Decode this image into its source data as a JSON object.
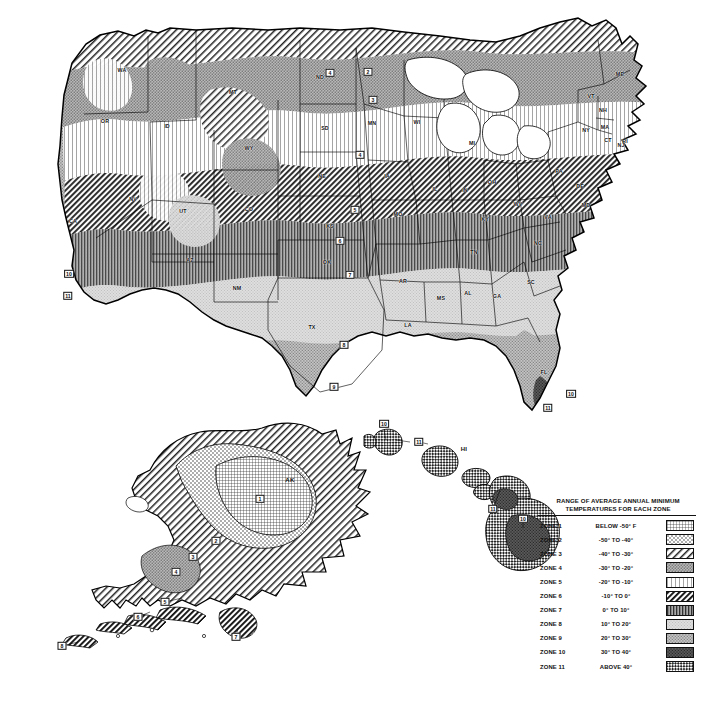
{
  "document": {
    "type": "map",
    "title": "USDA Plant Hardiness Zone Map",
    "corner_mark": "r"
  },
  "legend": {
    "heading_line1": "RANGE OF AVERAGE ANNUAL MINIMUM",
    "heading_line2": "TEMPERATURES FOR EACH ZONE",
    "rows": [
      {
        "zone": "ZONE 1",
        "range": "BELOW -50° F",
        "pattern": "grid-fine",
        "fill": "#ffffff",
        "ink": "#2b2b2b"
      },
      {
        "zone": "ZONE 2",
        "range": "-50°  TO -40°",
        "pattern": "dots-coarse",
        "fill": "#ffffff",
        "ink": "#333333"
      },
      {
        "zone": "ZONE 3",
        "range": "-40°  TO -30°",
        "pattern": "hatch-back-wide",
        "fill": "#ffffff",
        "ink": "#222222"
      },
      {
        "zone": "ZONE 4",
        "range": "-30°  TO -20°",
        "pattern": "stipple-mid",
        "fill": "#b9b9b9",
        "ink": "#4a4a4a"
      },
      {
        "zone": "ZONE 5",
        "range": "-20°  TO -10°",
        "pattern": "vert-light",
        "fill": "#ffffff",
        "ink": "#8a8a8a"
      },
      {
        "zone": "ZONE 6",
        "range": "-10°  TO   0°",
        "pattern": "hatch-back-bold",
        "fill": "#ffffff",
        "ink": "#111111"
      },
      {
        "zone": "ZONE 7",
        "range": "0°   TO  10°",
        "pattern": "vert-bold",
        "fill": "#a9a9a9",
        "ink": "#303030"
      },
      {
        "zone": "ZONE 8",
        "range": "10°   TO  20°",
        "pattern": "stipple-light",
        "fill": "#dedede",
        "ink": "#9a9a9a"
      },
      {
        "zone": "ZONE 9",
        "range": "20°   TO  30°",
        "pattern": "stipple-mid2",
        "fill": "#c4c4c4",
        "ink": "#6f6f6f"
      },
      {
        "zone": "ZONE 10",
        "range": "30°   TO  40°",
        "pattern": "dark-solid",
        "fill": "#5a5a5a",
        "ink": "#2a2a2a"
      },
      {
        "zone": "ZONE 11",
        "range": "ABOVE 40°",
        "pattern": "checker",
        "fill": "#ffffff",
        "ink": "#222222"
      }
    ]
  },
  "main_map": {
    "name": "contiguous-united-states",
    "state_labels": [
      {
        "abbr": "WA",
        "x": 122,
        "y": 70
      },
      {
        "abbr": "OR",
        "x": 105,
        "y": 121
      },
      {
        "abbr": "ID",
        "x": 167,
        "y": 126
      },
      {
        "abbr": "MT",
        "x": 233,
        "y": 92
      },
      {
        "abbr": "WY",
        "x": 249,
        "y": 148
      },
      {
        "abbr": "NV",
        "x": 133,
        "y": 199
      },
      {
        "abbr": "UT",
        "x": 183,
        "y": 211
      },
      {
        "abbr": "CA",
        "x": 73,
        "y": 221
      },
      {
        "abbr": "AZ",
        "x": 190,
        "y": 260
      },
      {
        "abbr": "NM",
        "x": 237,
        "y": 288
      },
      {
        "abbr": "CO",
        "x": 249,
        "y": 209
      },
      {
        "abbr": "ND",
        "x": 320,
        "y": 77
      },
      {
        "abbr": "SD",
        "x": 325,
        "y": 128
      },
      {
        "abbr": "NE",
        "x": 322,
        "y": 176
      },
      {
        "abbr": "KS",
        "x": 330,
        "y": 226
      },
      {
        "abbr": "OK",
        "x": 327,
        "y": 262
      },
      {
        "abbr": "TX",
        "x": 312,
        "y": 327
      },
      {
        "abbr": "MN",
        "x": 372,
        "y": 123
      },
      {
        "abbr": "IA",
        "x": 387,
        "y": 176
      },
      {
        "abbr": "MO",
        "x": 398,
        "y": 214
      },
      {
        "abbr": "AR",
        "x": 403,
        "y": 281
      },
      {
        "abbr": "LA",
        "x": 408,
        "y": 325
      },
      {
        "abbr": "WI",
        "x": 417,
        "y": 122
      },
      {
        "abbr": "IL",
        "x": 435,
        "y": 189
      },
      {
        "abbr": "MS",
        "x": 441,
        "y": 298
      },
      {
        "abbr": "AL",
        "x": 468,
        "y": 293
      },
      {
        "abbr": "MI",
        "x": 472,
        "y": 143
      },
      {
        "abbr": "IN",
        "x": 465,
        "y": 190
      },
      {
        "abbr": "OH",
        "x": 492,
        "y": 182
      },
      {
        "abbr": "KY",
        "x": 485,
        "y": 219
      },
      {
        "abbr": "TN",
        "x": 474,
        "y": 252
      },
      {
        "abbr": "GA",
        "x": 497,
        "y": 296
      },
      {
        "abbr": "FL",
        "x": 544,
        "y": 372
      },
      {
        "abbr": "SC",
        "x": 531,
        "y": 282
      },
      {
        "abbr": "NC",
        "x": 538,
        "y": 243
      },
      {
        "abbr": "WV",
        "x": 518,
        "y": 204
      },
      {
        "abbr": "VA",
        "x": 548,
        "y": 217
      },
      {
        "abbr": "MD",
        "x": 586,
        "y": 205
      },
      {
        "abbr": "DE",
        "x": 580,
        "y": 186
      },
      {
        "abbr": "PA",
        "x": 559,
        "y": 171
      },
      {
        "abbr": "NY",
        "x": 586,
        "y": 130
      },
      {
        "abbr": "NJ",
        "x": 621,
        "y": 145
      },
      {
        "abbr": "CT",
        "x": 608,
        "y": 140
      },
      {
        "abbr": "RI",
        "x": 625,
        "y": 141
      },
      {
        "abbr": "MA",
        "x": 605,
        "y": 127
      },
      {
        "abbr": "VT",
        "x": 591,
        "y": 96
      },
      {
        "abbr": "NH",
        "x": 603,
        "y": 110
      },
      {
        "abbr": "ME",
        "x": 620,
        "y": 74
      }
    ],
    "zone_markers": [
      {
        "zone": "4",
        "x": 330,
        "y": 73
      },
      {
        "zone": "3",
        "x": 373,
        "y": 100
      },
      {
        "zone": "2",
        "x": 368,
        "y": 72
      },
      {
        "zone": "4",
        "x": 360,
        "y": 155
      },
      {
        "zone": "5",
        "x": 355,
        "y": 210
      },
      {
        "zone": "6",
        "x": 340,
        "y": 241
      },
      {
        "zone": "7",
        "x": 350,
        "y": 275
      },
      {
        "zone": "8",
        "x": 344,
        "y": 345
      },
      {
        "zone": "9",
        "x": 334,
        "y": 387
      },
      {
        "zone": "10",
        "x": 69,
        "y": 274
      },
      {
        "zone": "11",
        "x": 68,
        "y": 296
      },
      {
        "zone": "10",
        "x": 571,
        "y": 394
      },
      {
        "zone": "11",
        "x": 548,
        "y": 408
      }
    ]
  },
  "alaska_inset": {
    "name": "alaska",
    "label": "AK",
    "label_x": 290,
    "label_y": 480,
    "zone_markers": [
      {
        "zone": "1",
        "x": 260,
        "y": 499
      },
      {
        "zone": "2",
        "x": 216,
        "y": 541
      },
      {
        "zone": "3",
        "x": 193,
        "y": 557
      },
      {
        "zone": "4",
        "x": 176,
        "y": 572
      },
      {
        "zone": "5",
        "x": 165,
        "y": 602
      },
      {
        "zone": "6",
        "x": 138,
        "y": 617
      },
      {
        "zone": "7",
        "x": 236,
        "y": 637
      },
      {
        "zone": "8",
        "x": 62,
        "y": 646
      }
    ]
  },
  "hawaii_inset": {
    "name": "hawaii",
    "label": "HI",
    "label_x": 464,
    "label_y": 449,
    "zone_markers": [
      {
        "zone": "10",
        "x": 384,
        "y": 424
      },
      {
        "zone": "11",
        "x": 419,
        "y": 442
      },
      {
        "zone": "11",
        "x": 493,
        "y": 509
      },
      {
        "zone": "10",
        "x": 523,
        "y": 519
      }
    ]
  }
}
